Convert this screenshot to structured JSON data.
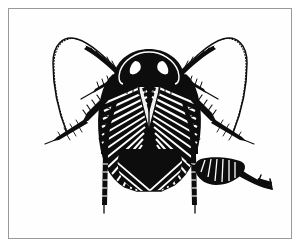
{
  "figure": {
    "title": "Cockroach dorsal view line illustration",
    "subject": "cockroach",
    "style": "pen-and-ink scientific illustration",
    "view": "dorsal",
    "background_color": "#ffffff",
    "ink_color": "#0d0d0d",
    "frame": {
      "name": "illustration-frame",
      "border_color": "#9a9a9a",
      "border_width_px": 1,
      "inset_px": 8
    },
    "parts": [
      {
        "id": "antenna-left",
        "label": "left antenna",
        "description": "long tapering antenna curving up and outward to the left, serrated along the inner edge"
      },
      {
        "id": "antenna-right",
        "label": "right antenna",
        "description": "long tapering antenna curving up and outward to the right, serrated along the inner edge"
      },
      {
        "id": "pronotum",
        "label": "pronotum",
        "description": "solid black shield-shaped plate covering the head"
      },
      {
        "id": "wings",
        "label": "tegmina / forewings",
        "description": "hatched wings with radiating diagonal lines meeting in a central V"
      },
      {
        "id": "abdomen",
        "label": "abdomen",
        "description": "hatched lower body tapering to a rounded tip"
      },
      {
        "id": "leg-front-left",
        "label": "front left leg",
        "description": "spined leg angled down and to the left"
      },
      {
        "id": "leg-front-right",
        "label": "front right leg",
        "description": "spined leg angled down and to the right"
      },
      {
        "id": "leg-mid-left",
        "label": "middle left leg",
        "description": "spined leg extending down-left to a tarsus"
      },
      {
        "id": "leg-mid-right",
        "label": "middle right leg",
        "description": "spined leg extending down-right to a tarsus"
      },
      {
        "id": "leg-hind-left",
        "label": "hind left leg",
        "description": "long segmented leg descending vertically"
      },
      {
        "id": "leg-hind-right",
        "label": "hind right leg",
        "description": "long segmented leg descending vertically"
      },
      {
        "id": "ootheca",
        "label": "egg case (ootheca)",
        "description": "ribbed dark capsule at lower right with a curving tapered tail"
      },
      {
        "id": "ootheca-mark",
        "label": "detached mark",
        "description": "small hooked ink mark to the right of the egg case tail"
      }
    ]
  }
}
